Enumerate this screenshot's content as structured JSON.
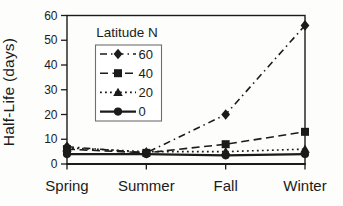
{
  "figure": {
    "background": "#fdfdfb",
    "ink": "#1b1b1b",
    "legend_border": "#6f6f6f"
  },
  "chart_data": {
    "type": "line",
    "title": "",
    "xlabel": "",
    "ylabel": "Half-Life (days)",
    "categories": [
      "Spring",
      "Summer",
      "Fall",
      "Winter"
    ],
    "ylim": [
      0,
      60
    ],
    "yticks": [
      0,
      10,
      20,
      30,
      40,
      50,
      60
    ],
    "grid": false,
    "legend": {
      "title": "Latitude N",
      "position": "upper-left-inside"
    },
    "series": [
      {
        "name": "60",
        "marker": "diamond",
        "line": "dashdot",
        "values": [
          7,
          4.5,
          20,
          56
        ]
      },
      {
        "name": "40",
        "marker": "square",
        "line": "dashed",
        "values": [
          6,
          4.5,
          8,
          13
        ]
      },
      {
        "name": "20",
        "marker": "triangle",
        "line": "dotted",
        "values": [
          6.5,
          5,
          5,
          6
        ]
      },
      {
        "name": "0",
        "marker": "circle",
        "line": "solid",
        "values": [
          4,
          4,
          3.5,
          4
        ]
      }
    ]
  }
}
